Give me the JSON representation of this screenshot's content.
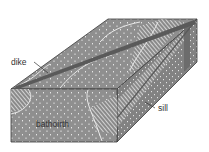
{
  "diagram": {
    "type": "geologic-block-diagram",
    "labels": {
      "dike": "dike",
      "sill": "sill",
      "batholith": "bathoirth"
    },
    "colors": {
      "rock_fill": "#8f8f8f",
      "rock_dark": "#7c7c7c",
      "dike_color": "#5a5a5a",
      "contact_line": "#e8e8e8",
      "edge": "#3a3a3a",
      "background": "#ffffff"
    }
  }
}
